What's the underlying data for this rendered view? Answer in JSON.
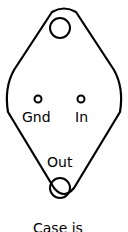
{
  "diagram": {
    "pins": {
      "gnd": "Gnd",
      "in": "In",
      "out": "Out"
    },
    "caption": "Case is",
    "stroke_color": "#000000",
    "background": "#ffffff"
  }
}
